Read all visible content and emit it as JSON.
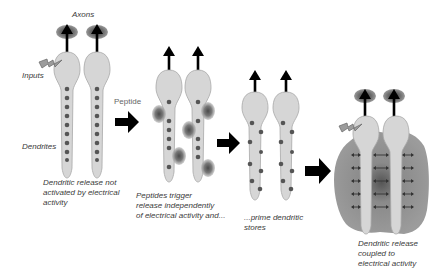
{
  "labels": {
    "axons": "Axons",
    "inputs": "Inputs",
    "dendrites": "Dendrites",
    "peptide": "Peptide"
  },
  "stages": [
    {
      "caption": "Dendritic release not\nactivated by electrical\nactivity"
    },
    {
      "caption": "Peptides trigger\nrelease independently\nof electrical activity and..."
    },
    {
      "caption": "...prime dendritic\nstores"
    },
    {
      "caption": "Dendritic release\ncoupled to\nelectrical activity"
    }
  ],
  "colors": {
    "neuron_fill": "#d6d6d6",
    "neuron_stroke": "#9a9a9a",
    "vesicle": "#555555",
    "arrow": "#000000",
    "halo": "#7a7a7a",
    "text": "#3a3a3a"
  }
}
